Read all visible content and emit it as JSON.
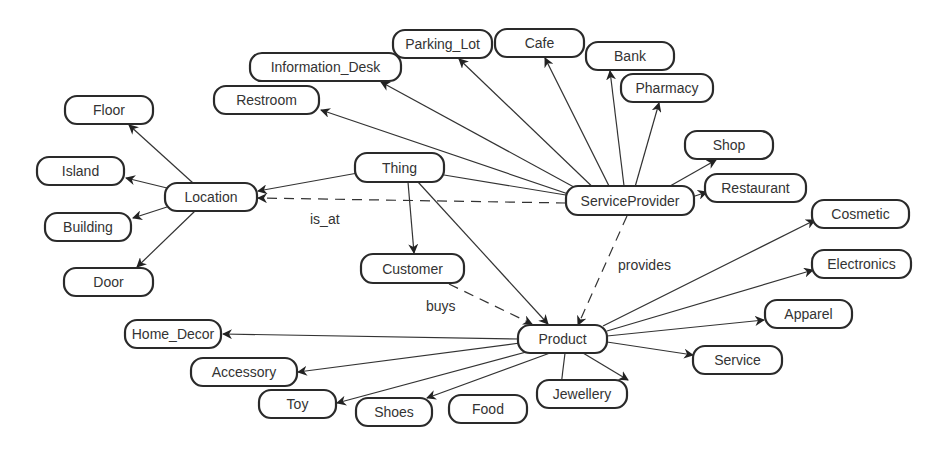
{
  "diagram": {
    "type": "ontology-concept-graph",
    "nodes": [
      {
        "id": "thing",
        "label": "Thing",
        "x": 355,
        "y": 153,
        "w": 89,
        "h": 29
      },
      {
        "id": "location",
        "label": "Location",
        "x": 165,
        "y": 183,
        "w": 92,
        "h": 28
      },
      {
        "id": "floor",
        "label": "Floor",
        "x": 65,
        "y": 96,
        "w": 88,
        "h": 28
      },
      {
        "id": "island",
        "label": "Island",
        "x": 37,
        "y": 157,
        "w": 87,
        "h": 28
      },
      {
        "id": "building",
        "label": "Building",
        "x": 45,
        "y": 213,
        "w": 86,
        "h": 28
      },
      {
        "id": "door",
        "label": "Door",
        "x": 64,
        "y": 268,
        "w": 89,
        "h": 28
      },
      {
        "id": "serviceprovider",
        "label": "ServiceProvider",
        "x": 566,
        "y": 186,
        "w": 128,
        "h": 29
      },
      {
        "id": "restroom",
        "label": "Restroom",
        "x": 214,
        "y": 86,
        "w": 105,
        "h": 28
      },
      {
        "id": "information_desk",
        "label": "Information_Desk",
        "x": 250,
        "y": 53,
        "w": 151,
        "h": 28
      },
      {
        "id": "parking_lot",
        "label": "Parking_Lot",
        "x": 393,
        "y": 30,
        "w": 99,
        "h": 28
      },
      {
        "id": "cafe",
        "label": "Cafe",
        "x": 495,
        "y": 29,
        "w": 89,
        "h": 28
      },
      {
        "id": "bank",
        "label": "Bank",
        "x": 586,
        "y": 42,
        "w": 88,
        "h": 28
      },
      {
        "id": "pharmacy",
        "label": "Pharmacy",
        "x": 621,
        "y": 74,
        "w": 92,
        "h": 28
      },
      {
        "id": "shop",
        "label": "Shop",
        "x": 685,
        "y": 131,
        "w": 88,
        "h": 28
      },
      {
        "id": "restaurant",
        "label": "Restaurant",
        "x": 705,
        "y": 174,
        "w": 101,
        "h": 28
      },
      {
        "id": "customer",
        "label": "Customer",
        "x": 361,
        "y": 254,
        "w": 103,
        "h": 29
      },
      {
        "id": "product",
        "label": "Product",
        "x": 518,
        "y": 325,
        "w": 89,
        "h": 28
      },
      {
        "id": "cosmetic",
        "label": "Cosmetic",
        "x": 812,
        "y": 200,
        "w": 97,
        "h": 28
      },
      {
        "id": "electronics",
        "label": "Electronics",
        "x": 812,
        "y": 250,
        "w": 99,
        "h": 28
      },
      {
        "id": "apparel",
        "label": "Apparel",
        "x": 765,
        "y": 300,
        "w": 87,
        "h": 28
      },
      {
        "id": "service",
        "label": "Service",
        "x": 693,
        "y": 346,
        "w": 89,
        "h": 28
      },
      {
        "id": "home_decor",
        "label": "Home_Decor",
        "x": 125,
        "y": 320,
        "w": 96,
        "h": 28
      },
      {
        "id": "accessory",
        "label": "Accessory",
        "x": 191,
        "y": 358,
        "w": 106,
        "h": 28
      },
      {
        "id": "toy",
        "label": "Toy",
        "x": 259,
        "y": 390,
        "w": 77,
        "h": 28
      },
      {
        "id": "shoes",
        "label": "Shoes",
        "x": 356,
        "y": 398,
        "w": 76,
        "h": 28
      },
      {
        "id": "food",
        "label": "Food",
        "x": 449,
        "y": 395,
        "w": 78,
        "h": 28
      },
      {
        "id": "jewellery",
        "label": "Jewellery",
        "x": 537,
        "y": 380,
        "w": 90,
        "h": 28
      }
    ],
    "edges": [
      {
        "from": [
          380,
          169
        ],
        "to": [
          258,
          191
        ],
        "style": "solid",
        "label": ""
      },
      {
        "from": [
          408,
          182
        ],
        "to": [
          414,
          253
        ],
        "style": "solid",
        "label": ""
      },
      {
        "from": [
          418,
          182
        ],
        "to": [
          548,
          324
        ],
        "style": "solid",
        "label": ""
      },
      {
        "from": [
          444,
          175
        ],
        "to": [
          578,
          197
        ],
        "style": "solid",
        "label": ""
      },
      {
        "from": [
          193,
          183
        ],
        "to": [
          129,
          125
        ],
        "style": "solid",
        "label": ""
      },
      {
        "from": [
          167,
          188
        ],
        "to": [
          126,
          178
        ],
        "style": "solid",
        "label": ""
      },
      {
        "from": [
          167,
          207
        ],
        "to": [
          133,
          218
        ],
        "style": "solid",
        "label": ""
      },
      {
        "from": [
          195,
          211
        ],
        "to": [
          137,
          267
        ],
        "style": "solid",
        "label": ""
      },
      {
        "from": [
          586,
          200
        ],
        "to": [
          321,
          110
        ],
        "style": "solid",
        "label": ""
      },
      {
        "from": [
          594,
          198
        ],
        "to": [
          381,
          82
        ],
        "style": "solid",
        "label": ""
      },
      {
        "from": [
          602,
          196
        ],
        "to": [
          459,
          59
        ],
        "style": "solid",
        "label": ""
      },
      {
        "from": [
          613,
          194
        ],
        "to": [
          545,
          58
        ],
        "style": "solid",
        "label": ""
      },
      {
        "from": [
          625,
          194
        ],
        "to": [
          610,
          71
        ],
        "style": "solid",
        "label": ""
      },
      {
        "from": [
          633,
          194
        ],
        "to": [
          659,
          103
        ],
        "style": "solid",
        "label": ""
      },
      {
        "from": [
          656,
          194
        ],
        "to": [
          716,
          160
        ],
        "style": "solid",
        "label": ""
      },
      {
        "from": [
          689,
          198
        ],
        "to": [
          707,
          192
        ],
        "style": "solid",
        "label": ""
      },
      {
        "from": [
          566,
          203
        ],
        "to": [
          258,
          198
        ],
        "style": "dashed",
        "label": "is_at",
        "lx": 310,
        "ly": 224
      },
      {
        "from": [
          627,
          216
        ],
        "to": [
          578,
          325
        ],
        "style": "dashed",
        "label": "provides",
        "lx": 618,
        "ly": 270
      },
      {
        "from": [
          449,
          284
        ],
        "to": [
          532,
          324
        ],
        "style": "dashed",
        "label": "buys",
        "lx": 426,
        "ly": 311
      },
      {
        "from": [
          520,
          339
        ],
        "to": [
          223,
          334
        ],
        "style": "solid",
        "label": ""
      },
      {
        "from": [
          520,
          343
        ],
        "to": [
          298,
          372
        ],
        "style": "solid",
        "label": ""
      },
      {
        "from": [
          530,
          351
        ],
        "to": [
          337,
          403
        ],
        "style": "solid",
        "label": ""
      },
      {
        "from": [
          550,
          353
        ],
        "to": [
          427,
          398
        ],
        "style": "solid",
        "label": ""
      },
      {
        "from": [
          565,
          353
        ],
        "to": [
          560,
          394
        ],
        "style": "solid",
        "label": ""
      },
      {
        "from": [
          583,
          353
        ],
        "to": [
          628,
          380
        ],
        "style": "solid",
        "label": ""
      },
      {
        "from": [
          607,
          342
        ],
        "to": [
          693,
          355
        ],
        "style": "solid",
        "label": ""
      },
      {
        "from": [
          607,
          336
        ],
        "to": [
          764,
          320
        ],
        "style": "solid",
        "label": ""
      },
      {
        "from": [
          607,
          331
        ],
        "to": [
          813,
          270
        ],
        "style": "solid",
        "label": ""
      },
      {
        "from": [
          603,
          326
        ],
        "to": [
          815,
          220
        ],
        "style": "solid",
        "label": ""
      }
    ]
  }
}
